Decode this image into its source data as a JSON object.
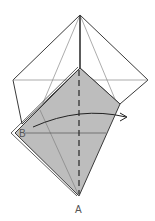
{
  "diagram": {
    "type": "origami-fold-step",
    "labels": {
      "point_a": "A",
      "point_b": "B"
    },
    "colors": {
      "paper_front": "#ffffff",
      "paper_back": "#bdbdbd",
      "line": "#3a3a3a",
      "thin_line": "#777777",
      "label": "#555555"
    },
    "instructions": {
      "fold_line": "valley-fold (dashed, vertical through A)",
      "arrow": "fold point B across to the right"
    }
  }
}
